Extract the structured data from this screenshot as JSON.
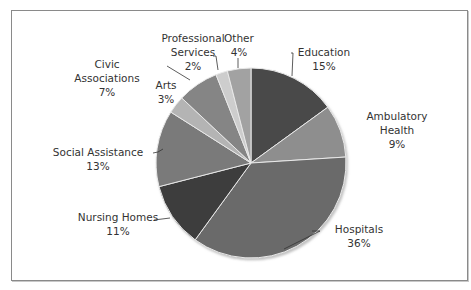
{
  "chart_data": {
    "type": "pie",
    "title": "",
    "start_angle_deg": 0,
    "direction": "clockwise",
    "slices": [
      {
        "label": "Education",
        "value": 15,
        "pct_label": "15%",
        "color": "#4a4a4a"
      },
      {
        "label": "Ambulatory Health",
        "value": 9,
        "pct_label": "9%",
        "color": "#8e8e8e"
      },
      {
        "label": "Hospitals",
        "value": 36,
        "pct_label": "36%",
        "color": "#6b6b6b"
      },
      {
        "label": "Nursing Homes",
        "value": 11,
        "pct_label": "11%",
        "color": "#3e3e3e"
      },
      {
        "label": "Social Assistance",
        "value": 13,
        "pct_label": "13%",
        "color": "#7a7a7a"
      },
      {
        "label": "Arts",
        "value": 3,
        "pct_label": "3%",
        "color": "#b4b4b4"
      },
      {
        "label": "Civic Associations",
        "value": 7,
        "pct_label": "7%",
        "color": "#858585"
      },
      {
        "label": "Professional Services",
        "value": 2,
        "pct_label": "2%",
        "color": "#cdcdcd"
      },
      {
        "label": "Other",
        "value": 4,
        "pct_label": "4%",
        "color": "#a2a2a2"
      }
    ],
    "legend": "none (data labels with leader lines)"
  },
  "labels": {
    "education": {
      "name": "Education",
      "pct": "15%"
    },
    "ambulatory": {
      "line1": "Ambulatory",
      "line2": "Health",
      "pct": "9%"
    },
    "hospitals": {
      "name": "Hospitals",
      "pct": "36%"
    },
    "nursing": {
      "name": "Nursing Homes",
      "pct": "11%"
    },
    "social": {
      "name": "Social Assistance",
      "pct": "13%"
    },
    "arts": {
      "name": "Arts",
      "pct": "3%"
    },
    "civic": {
      "line1": "Civic",
      "line2": "Associations",
      "pct": "7%"
    },
    "professional": {
      "line1": "Professional",
      "line2": "Services",
      "pct": "2%"
    },
    "other": {
      "name": "Other",
      "pct": "4%"
    }
  }
}
